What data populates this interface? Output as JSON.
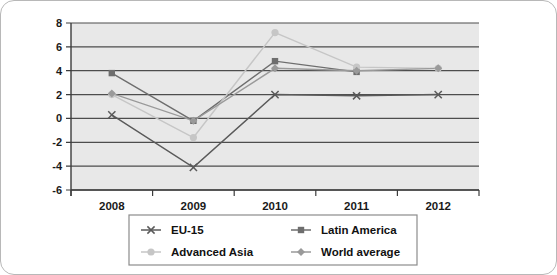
{
  "chart_data": {
    "type": "line",
    "title": "",
    "subtitle": "",
    "xlabel": "",
    "ylabel": "",
    "categories": [
      "2008",
      "2009",
      "2010",
      "2011",
      "2012"
    ],
    "ylim": [
      -6,
      8
    ],
    "yticks": [
      8,
      6,
      4,
      2,
      0,
      -2,
      -4,
      -6
    ],
    "ytick_labels": [
      "8",
      "6",
      "4",
      "2",
      "0",
      "-2",
      "-4",
      "-6"
    ],
    "grid": true,
    "grid_orientation": "horizontal",
    "legend_position": "bottom",
    "plot_background": "#e8e8e8",
    "series": [
      {
        "name": "EU-15",
        "marker": "x",
        "color": "#5a5a5a",
        "values": [
          0.3,
          -4.1,
          2.0,
          1.9,
          2.0
        ]
      },
      {
        "name": "Latin America",
        "marker": "square",
        "color": "#6e6e6e",
        "values": [
          3.8,
          -0.2,
          4.8,
          3.9,
          null
        ]
      },
      {
        "name": "Advanced Asia",
        "marker": "circle",
        "color": "#c6c6c6",
        "values": [
          2.0,
          -1.6,
          7.2,
          4.3,
          4.2
        ]
      },
      {
        "name": "World average",
        "marker": "diamond",
        "color": "#9a9a9a",
        "values": [
          2.1,
          -0.2,
          4.2,
          4.0,
          4.2
        ]
      }
    ]
  },
  "axes": {
    "y_axis_name": "value-axis",
    "x_axis_name": "year-axis"
  },
  "legend": {
    "entries": [
      {
        "label": "EU-15",
        "marker": "x",
        "color": "#5a5a5a"
      },
      {
        "label": "Latin America",
        "marker": "square",
        "color": "#6e6e6e"
      },
      {
        "label": "Advanced Asia",
        "marker": "circle",
        "color": "#c6c6c6"
      },
      {
        "label": "World average",
        "marker": "diamond",
        "color": "#9a9a9a"
      }
    ],
    "border_color": "#8c8c8c"
  }
}
